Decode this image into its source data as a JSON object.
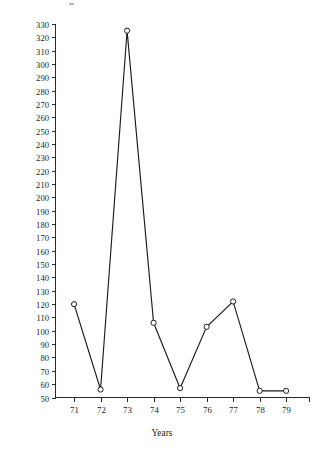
{
  "chart_data": {
    "type": "line",
    "title": "",
    "xlabel": "Years",
    "ylabel": "Customers affected per interruption (×10",
    "ylabel_exponent": "3",
    "ylabel_suffix": ")",
    "categories": [
      "71",
      "72",
      "73",
      "74",
      "75",
      "76",
      "77",
      "78",
      "79"
    ],
    "x": [
      71,
      72,
      73,
      74,
      75,
      76,
      77,
      78,
      79
    ],
    "values": [
      120,
      56,
      325,
      106,
      57,
      103,
      122,
      55,
      55
    ],
    "series": [
      {
        "name": "Customers affected per interruption",
        "values": [
          120,
          56,
          325,
          106,
          57,
          103,
          122,
          55,
          55
        ]
      }
    ],
    "ylim": [
      50,
      330
    ],
    "ytick_step": 10,
    "yticks": [
      "50",
      "60",
      "70",
      "80",
      "90",
      "100",
      "110",
      "120",
      "130",
      "140",
      "150",
      "160",
      "170",
      "180",
      "190",
      "200",
      "210",
      "220",
      "230",
      "240",
      "250",
      "260",
      "270",
      "280",
      "290",
      "300",
      "310",
      "320",
      "330"
    ],
    "xlim": [
      70.3,
      79.9
    ],
    "xticks": [
      "71",
      "72",
      "73",
      "74",
      "75",
      "76",
      "77",
      "78",
      "79"
    ],
    "grid": false,
    "legend": false,
    "legend_position": "none",
    "marker": "open-circle",
    "line_color": "#1c1c1c",
    "marker_fill": "#ffffff",
    "axis_color": "#2a2a2a",
    "background": "#ffffff",
    "tick_direction": "out"
  }
}
